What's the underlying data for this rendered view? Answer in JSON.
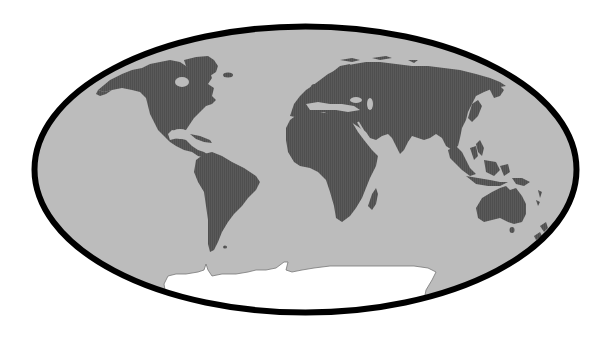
{
  "map": {
    "projection": "elliptical-world",
    "colors": {
      "background": "#ffffff",
      "ocean": "#bcbcbc",
      "land": "#5a5a5a",
      "land_stripe": "#505050",
      "ice": "#ffffff",
      "ice_outline": "#777777",
      "border": "#000000"
    },
    "regions": [
      {
        "id": "north-america",
        "label": "North America"
      },
      {
        "id": "greenland",
        "label": "Greenland"
      },
      {
        "id": "south-america",
        "label": "South America"
      },
      {
        "id": "europe-asia",
        "label": "Eurasia"
      },
      {
        "id": "africa",
        "label": "Africa"
      },
      {
        "id": "madagascar",
        "label": "Madagascar"
      },
      {
        "id": "southeast-asia",
        "label": "Maritime Southeast Asia"
      },
      {
        "id": "australia",
        "label": "Australia"
      },
      {
        "id": "new-zealand",
        "label": "New Zealand"
      },
      {
        "id": "antarctica",
        "label": "Antarctica"
      }
    ]
  }
}
